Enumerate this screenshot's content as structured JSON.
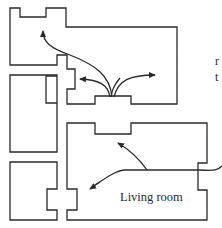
{
  "diagram": {
    "type": "floor-plan",
    "labels": {
      "living_room": "Living room"
    },
    "edge_text": {
      "line1": "r",
      "line2": "t"
    },
    "colors": {
      "line": "#2a2a2a",
      "background": "#ffffff"
    },
    "rooms": [
      {
        "name": "top-room"
      },
      {
        "name": "left-upper-room"
      },
      {
        "name": "left-lower-room"
      },
      {
        "name": "living-room"
      }
    ],
    "arrows": [
      {
        "name": "arrow-to-top-room-upper-left"
      },
      {
        "name": "arrow-to-top-room-left"
      },
      {
        "name": "arrow-to-top-room-right"
      },
      {
        "name": "arrow-to-living-room-upper"
      },
      {
        "name": "arrow-to-living-room-lower-left"
      }
    ]
  }
}
